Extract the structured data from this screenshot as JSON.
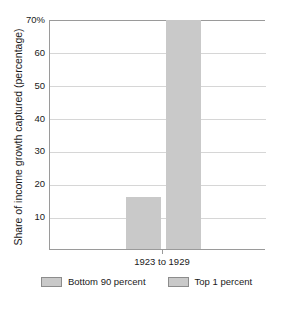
{
  "chart_data": {
    "type": "bar",
    "title": "",
    "subtitle": "",
    "xlabel": "",
    "ylabel": "Share of income growth captured (percentage)",
    "categories": [
      "1923 to 1929"
    ],
    "series": [
      {
        "name": "Bottom 90 percent",
        "values": [
          16
        ],
        "color": "#c9c9c9"
      },
      {
        "name": "Top 1 percent",
        "values": [
          70
        ],
        "color": "#c9c9c9"
      }
    ],
    "ylim": [
      0,
      70
    ],
    "yticks": [
      {
        "value": 70,
        "label": "70%"
      },
      {
        "value": 60,
        "label": "60"
      },
      {
        "value": 50,
        "label": "50"
      },
      {
        "value": 40,
        "label": "40"
      },
      {
        "value": 30,
        "label": "30"
      },
      {
        "value": 20,
        "label": "20"
      },
      {
        "value": 10,
        "label": "10"
      }
    ],
    "grid": true,
    "grid_axis": "y",
    "legend_position": "bottom",
    "annotations": []
  },
  "colors": {
    "bar_fill": "#c9c9c9",
    "gridline": "#d6d6d6",
    "axis_line": "#9a9a9a",
    "text": "#1a1a1a",
    "background": "#ffffff",
    "legend_swatch_border": "#8c8c8c"
  }
}
